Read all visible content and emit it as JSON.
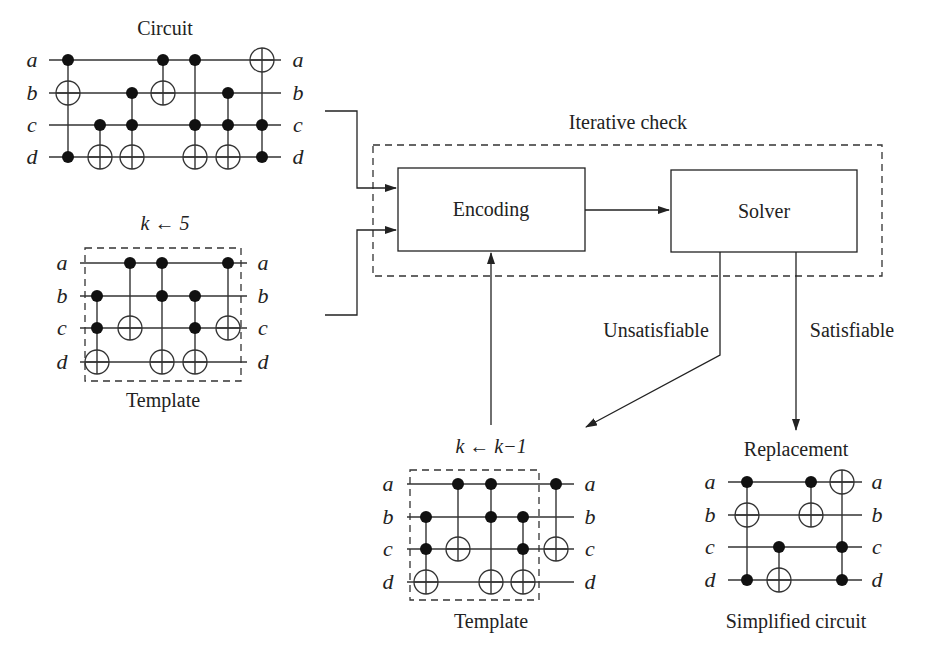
{
  "labels": {
    "circuit_title": "Circuit",
    "template_k5": "k ← 5",
    "template_caption": "Template",
    "iterative_check": "Iterative check",
    "encoding": "Encoding",
    "solver": "Solver",
    "unsatisfiable": "Unsatisfiable",
    "satisfiable": "Satisfiable",
    "k_decrement": "k ← k−1",
    "template2_caption": "Template",
    "replacement": "Replacement",
    "simplified_caption": "Simplified circuit"
  },
  "wire_names": [
    "a",
    "b",
    "c",
    "d"
  ],
  "circuits": {
    "circuit": {
      "wires_y": [
        60,
        93,
        125,
        157
      ],
      "x0": 49,
      "x1": 281,
      "lx": 32,
      "rx": 298,
      "gates": [
        {
          "x": 68,
          "controls": [
            0,
            3
          ],
          "target": 1
        },
        {
          "x": 100,
          "controls": [
            2
          ],
          "target": 3
        },
        {
          "x": 132,
          "controls": [
            1,
            2
          ],
          "target": 3
        },
        {
          "x": 163,
          "controls": [
            0
          ],
          "target": 1
        },
        {
          "x": 195,
          "controls": [
            0,
            2
          ],
          "target": 3
        },
        {
          "x": 228,
          "controls": [
            1,
            2
          ],
          "target": 3
        },
        {
          "x": 262,
          "controls": [
            2,
            3
          ],
          "target": 0
        }
      ]
    },
    "template1": {
      "wires_y": [
        263,
        296,
        328,
        362
      ],
      "x0": 80,
      "x1": 247,
      "lx": 62,
      "rx": 263,
      "gates": [
        {
          "x": 97,
          "controls": [
            1,
            2
          ],
          "target": 3
        },
        {
          "x": 130,
          "controls": [
            0
          ],
          "target": 2
        },
        {
          "x": 162,
          "controls": [
            0,
            1
          ],
          "target": 3
        },
        {
          "x": 195,
          "controls": [
            1,
            2
          ],
          "target": 3
        },
        {
          "x": 228,
          "controls": [
            0
          ],
          "target": 2
        }
      ],
      "box": [
        85,
        248,
        156,
        133
      ]
    },
    "template2": {
      "wires_y": [
        484,
        517,
        549,
        582
      ],
      "x0": 407,
      "x1": 574,
      "lx": 388,
      "rx": 590,
      "gates": [
        {
          "x": 426,
          "controls": [
            1,
            2
          ],
          "target": 3
        },
        {
          "x": 458,
          "controls": [
            0
          ],
          "target": 2
        },
        {
          "x": 491,
          "controls": [
            0,
            1
          ],
          "target": 3
        },
        {
          "x": 523,
          "controls": [
            1,
            2
          ],
          "target": 3
        },
        {
          "x": 556,
          "controls": [
            0
          ],
          "target": 2
        }
      ],
      "box": [
        410,
        470,
        129,
        130
      ]
    },
    "simplified": {
      "wires_y": [
        482,
        515,
        547,
        580
      ],
      "x0": 728,
      "x1": 862,
      "lx": 710,
      "rx": 877,
      "gates": [
        {
          "x": 747,
          "controls": [
            0,
            3
          ],
          "target": 1
        },
        {
          "x": 779,
          "controls": [
            2
          ],
          "target": 3
        },
        {
          "x": 811,
          "controls": [
            0
          ],
          "target": 1
        },
        {
          "x": 842,
          "controls": [
            2,
            3
          ],
          "target": 0
        }
      ]
    }
  }
}
